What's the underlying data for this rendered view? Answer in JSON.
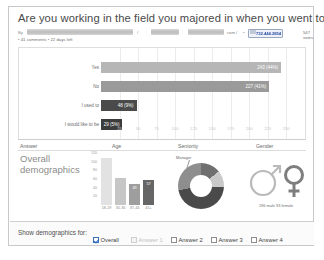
{
  "poll": {
    "question": "Are you working in the field you majored in when you went to college?",
    "by_label": "By",
    "author_redacted": "",
    "site_suffix": "com /",
    "phone": "732.444.2854",
    "votes": "547 votes",
    "comments": "41 comments",
    "days_left": "22 days left",
    "bullet": "•",
    "separator": "/"
  },
  "chart_data": {
    "type": "bar",
    "orientation": "horizontal",
    "title": "Are you working in the field you majored in when you went to college?",
    "categories": [
      "Yes",
      "No",
      "I used to",
      "I would like to be"
    ],
    "values": [
      243,
      227,
      48,
      29
    ],
    "percents": [
      "44%",
      "41%",
      "9%",
      "5%"
    ],
    "labels": [
      "243 (44%)",
      "227 (41%)",
      "48 (9%)",
      "29 (5%)"
    ],
    "colors": [
      "#b6b6b6",
      "#9a9a9a",
      "#4a4a4a",
      "#3c3c3c"
    ],
    "xlabel": "",
    "ylabel": "",
    "xlim": [
      0,
      270
    ],
    "xticks": [
      "25",
      "50",
      "75",
      "100",
      "125",
      "150",
      "175",
      "200",
      "225",
      "250"
    ],
    "grid": true,
    "total_votes": 547
  },
  "demographics": {
    "columns": [
      "Answer",
      "Age",
      "Seniority",
      "Gender"
    ],
    "row_label_line1": "Overall",
    "row_label_line2": "demographics",
    "age_chart": {
      "type": "bar",
      "categories": [
        "18-29",
        "30-36",
        "37-44",
        "45+"
      ],
      "values": [
        108,
        62,
        49,
        57
      ],
      "value_labels": [
        "",
        "",
        "49",
        "57"
      ],
      "yticks": [
        "120",
        "100",
        "80",
        "60",
        "40",
        "20"
      ],
      "ylim": [
        0,
        120
      ],
      "colors": [
        "#e2e2e2",
        "#c6c6c6",
        "#9e9e9e",
        "#666666"
      ]
    },
    "seniority_chart": {
      "type": "pie",
      "annotation": "Manager",
      "slices": [
        {
          "label": "Manager",
          "value": 14,
          "color": "#6f6f6f"
        },
        {
          "label": "segment-2",
          "value": 12,
          "color": "#c9c9c9"
        },
        {
          "label": "segment-3",
          "value": 46,
          "color": "#4a4a4a"
        },
        {
          "label": "segment-4",
          "value": 28,
          "color": "#8e8e8e"
        }
      ]
    },
    "gender": {
      "caption": "196 male  93 female",
      "male_symbol": "♂",
      "female_symbol": "♀"
    }
  },
  "footer": {
    "label": "Show demographics for:",
    "options": [
      {
        "label": "Overall",
        "checked": true,
        "disabled": false
      },
      {
        "label": "Answer 1",
        "checked": false,
        "disabled": true
      },
      {
        "label": "Answer 2",
        "checked": false,
        "disabled": false
      },
      {
        "label": "Answer 3",
        "checked": false,
        "disabled": false
      },
      {
        "label": "Answer 4",
        "checked": false,
        "disabled": false
      }
    ]
  }
}
